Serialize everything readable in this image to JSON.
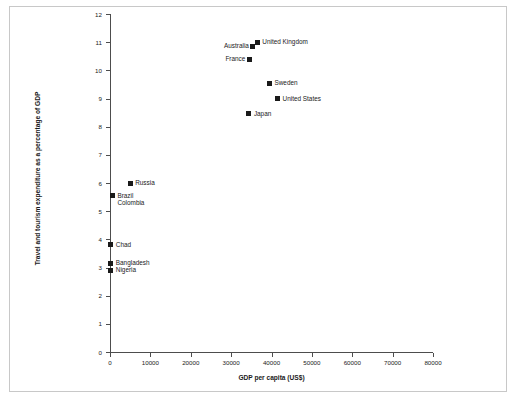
{
  "chart_data": {
    "type": "scatter",
    "title": "",
    "xlabel": "GDP per capita (US$)",
    "ylabel": "Travel and tourism expenditure as a percentage of GDP",
    "xlim": [
      0,
      80000
    ],
    "ylim": [
      0,
      12
    ],
    "xticks": [
      "0",
      "10000",
      "20000",
      "30000",
      "40000",
      "50000",
      "60000",
      "70000",
      "80000"
    ],
    "xtick_values": [
      0,
      10000,
      20000,
      30000,
      40000,
      50000,
      60000,
      70000,
      80000
    ],
    "yticks": [
      "0",
      "1",
      "2",
      "3",
      "4",
      "5",
      "6",
      "7",
      "8",
      "9",
      "10",
      "11",
      "12"
    ],
    "ytick_values": [
      0,
      1,
      2,
      3,
      4,
      5,
      6,
      7,
      8,
      9,
      10,
      11,
      12
    ],
    "grid": false,
    "legend": "none",
    "marker_color": "#1a1a1a",
    "marker_shape": "square",
    "points": [
      {
        "label": "United Kingdom",
        "x": 36500,
        "y": 11.0,
        "label_side": "right"
      },
      {
        "label": "Australia",
        "x": 35400,
        "y": 10.85,
        "label_side": "left"
      },
      {
        "label": "France",
        "x": 34500,
        "y": 10.4,
        "label_side": "left"
      },
      {
        "label": "Sweden",
        "x": 39500,
        "y": 9.55,
        "label_side": "right"
      },
      {
        "label": "United States",
        "x": 41500,
        "y": 9.0,
        "label_side": "right"
      },
      {
        "label": "Japan",
        "x": 34400,
        "y": 8.45,
        "label_side": "right"
      },
      {
        "label": "Russia",
        "x": 5000,
        "y": 6.0,
        "label_side": "right"
      },
      {
        "label": "Brazil",
        "x": 600,
        "y": 5.55,
        "label_side": "right"
      },
      {
        "label": "Colombia",
        "x": 600,
        "y": 5.55,
        "label_side": "right-below"
      },
      {
        "label": "Chad",
        "x": 200,
        "y": 3.8,
        "label_side": "right"
      },
      {
        "label": "Bangladesh",
        "x": 200,
        "y": 3.15,
        "label_side": "right"
      },
      {
        "label": "Nigeria",
        "x": 200,
        "y": 2.9,
        "label_side": "right"
      }
    ]
  }
}
